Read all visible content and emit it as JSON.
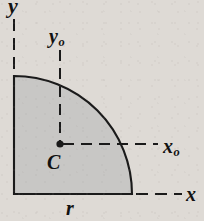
{
  "figure": {
    "background_color": "#dedad5",
    "fill_color": "#c8c7c5",
    "stroke_color": "#1a1a1a"
  },
  "labels": {
    "y_axis": "y",
    "y_centroid": "y",
    "y_centroid_sub": "o",
    "x_centroid": "x",
    "x_centroid_sub": "o",
    "x_axis": "x",
    "centroid_point": "C",
    "radius": "r"
  },
  "geometry": {
    "origin_x": 14,
    "origin_y": 194,
    "radius_px": 118,
    "centroid_x": 60,
    "centroid_y": 144,
    "arc_start_x": 14,
    "arc_start_y": 76,
    "arc_end_x": 132,
    "arc_end_y": 194
  }
}
